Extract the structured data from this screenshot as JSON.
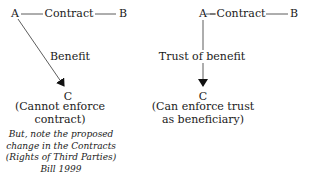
{
  "left_diagram": {
    "party_a": "A",
    "contract_label": "Contract",
    "party_b": "B",
    "arrow_label": "Benefit",
    "party_c": "C",
    "c_caption_line1": "(Cannot enforce",
    "c_caption_line2": "contract)",
    "note_lines": [
      "But, note the proposed",
      "change in the Contracts",
      "(Rights of Third Parties)",
      "Bill 1999"
    ]
  },
  "right_diagram": {
    "party_a": "A",
    "contract_label": "Contract",
    "party_b": "B",
    "arrow_label": "Trust of benefit",
    "party_c": "C",
    "c_caption_line1": "(Can enforce trust",
    "c_caption_line2": "as beneficiary)"
  }
}
